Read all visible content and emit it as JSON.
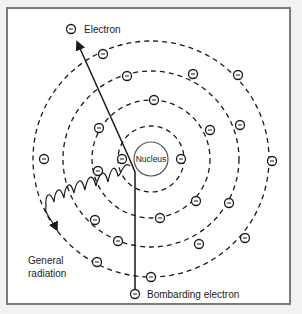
{
  "diagram": {
    "labels": {
      "electron": "Electron",
      "nucleus": "Nucleus",
      "general_radiation_line1": "General",
      "general_radiation_line2": "radiation",
      "bombarding_electron": "Bombarding electron"
    },
    "electron_symbol": "−",
    "colors": {
      "stroke": "#1a1a1a",
      "frame": "#7a7a7a",
      "background": "#ffffff"
    }
  }
}
